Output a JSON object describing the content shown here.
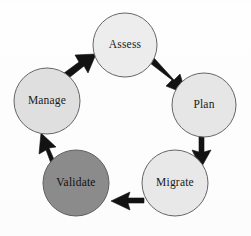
{
  "diagram": {
    "type": "cycle",
    "background_color": "#fefefe",
    "direction": "clockwise",
    "nodes": [
      {
        "id": "assess",
        "label": "Assess",
        "cx": 125,
        "cy": 45,
        "r": 32,
        "fill": "#e9e9e9",
        "stroke": "#5a5a5a",
        "highlighted": false
      },
      {
        "id": "plan",
        "label": "Plan",
        "cx": 204,
        "cy": 105,
        "r": 32,
        "fill": "#e9e9e9",
        "stroke": "#5a5a5a",
        "highlighted": false
      },
      {
        "id": "migrate",
        "label": "Migrate",
        "cx": 175,
        "cy": 183,
        "r": 33,
        "fill": "#e9e9e9",
        "stroke": "#5a5a5a",
        "highlighted": false
      },
      {
        "id": "validate",
        "label": "Validate",
        "cx": 76,
        "cy": 183,
        "r": 33,
        "fill": "#8c8c8c",
        "stroke": "#5a5a5a",
        "highlighted": true
      },
      {
        "id": "manage",
        "label": "Manage",
        "cx": 47,
        "cy": 101,
        "r": 33,
        "fill": "#e0e0e0",
        "stroke": "#5a5a5a",
        "highlighted": false
      }
    ],
    "arrows": [
      {
        "id": "assess-to-plan",
        "from": "assess",
        "to": "plan",
        "color": "#121212"
      },
      {
        "id": "plan-to-migrate",
        "from": "plan",
        "to": "migrate",
        "color": "#121212"
      },
      {
        "id": "migrate-to-validate",
        "from": "migrate",
        "to": "validate",
        "color": "#121212"
      },
      {
        "id": "validate-to-manage",
        "from": "validate",
        "to": "manage",
        "color": "#121212"
      },
      {
        "id": "manage-to-assess",
        "from": "manage",
        "to": "assess",
        "color": "#121212"
      }
    ]
  }
}
